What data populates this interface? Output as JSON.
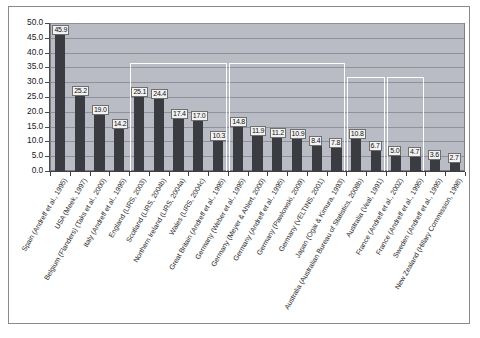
{
  "chart_data": {
    "type": "bar",
    "title": "",
    "subtitle": "",
    "xlabel": "",
    "ylabel": "",
    "ylim": [
      0,
      50
    ],
    "ytick_step": 5,
    "grid": true,
    "legend": "none",
    "orientation": "vertical",
    "bar_color": "#3b3b42",
    "plot_background": "#b9bcc4",
    "gridline_color": "#8e9199",
    "bracket_color": "#ffffff",
    "y_ticks": [
      "0.0",
      "5.0",
      "10.0",
      "15.0",
      "20.0",
      "25.0",
      "30.0",
      "35.0",
      "40.0",
      "45.0",
      "50.0"
    ],
    "categories": [
      "Spain (Andreff et al., 1995)",
      "USA (Meek, 1997)",
      "Belgium (Flanders) (Taks et al., 2000)",
      "Italy (Andreff et al., 1995)",
      "England (LIRS, 2003)",
      "Scotland (LIRS, 2004b)",
      "Northern Ireland (LIRS, 2004a)",
      "Wales (LIRS, 2004c)",
      "Great Britain (Andreff et al., 1995)",
      "Germany (Weber et al., 1995)",
      "Germany (Meyer & Ahlert, 2000)",
      "Germany (Andreff et al., 1995)",
      "Germany (Pawlowski, 2009)",
      "Germany (VELTINS, 2001)",
      "Japan (Ogai & Kimura, 1993)",
      "Australia (Australian Bureau of Statistics, 2008b)",
      "Australia (Veal, 1991)",
      "France (Andreff et al., 2002)",
      "France (Andreff et al., 1995)",
      "Sweden (Andreff et al., 1995)",
      "New Zealand (Hillary Commission, 1998)"
    ],
    "values": [
      45.9,
      25.2,
      19.0,
      14.2,
      25.1,
      24.4,
      17.4,
      17.0,
      10.3,
      14.8,
      11.9,
      11.2,
      10.9,
      8.4,
      7.8,
      10.8,
      6.7,
      5.0,
      4.7,
      3.6,
      2.7
    ],
    "value_labels": [
      "45.9",
      "25.2",
      "19.0",
      "14.2",
      "25.1",
      "24.4",
      "17.4",
      "17.0",
      "10.3",
      "14.8",
      "11.9",
      "11.2",
      "10.9",
      "8.4",
      "7.8",
      "10.8",
      "6.7",
      "5.0",
      "4.7",
      "3.6",
      "2.7"
    ],
    "groups": [
      {
        "name": "uk-group",
        "start_index": 4,
        "end_index": 8
      },
      {
        "name": "germany-group",
        "start_index": 9,
        "end_index": 14
      },
      {
        "name": "australia-group",
        "start_index": 15,
        "end_index": 16
      },
      {
        "name": "france-group",
        "start_index": 17,
        "end_index": 18
      }
    ]
  }
}
